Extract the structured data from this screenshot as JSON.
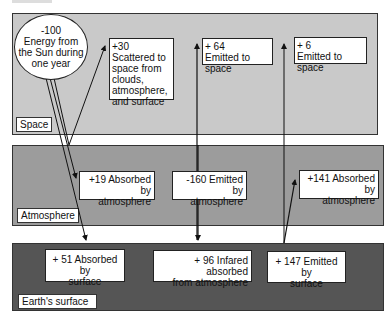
{
  "diagram": {
    "type": "energy-balance-flow",
    "layers": [
      {
        "id": "space",
        "label": "Space",
        "color": "#c9c9c9"
      },
      {
        "id": "atmosphere",
        "label": "Atmosphere",
        "color": "#9c9c9c"
      },
      {
        "id": "surface",
        "label": "Earth's surface",
        "color": "#555555"
      }
    ],
    "sun": {
      "line1": "-100",
      "line2": "Energy from",
      "line3": "the Sun during",
      "line4": "one year"
    },
    "flows": {
      "scattered": {
        "value": "+30",
        "l1": "Scattered to",
        "l2": "space from",
        "l3": "clouds,",
        "l4": "atmosphere,",
        "l5": "and surface"
      },
      "emitted64": {
        "value": "+ 64",
        "text": "Emitted to space"
      },
      "emitted6": {
        "value": "+ 6",
        "text": "Emitted to space"
      },
      "absorbed19": {
        "l1": "+19 Absorbed by",
        "l2": "atmosphere"
      },
      "emitted160": {
        "l1": "-160 Emitted by",
        "l2": "atmosphere"
      },
      "absorbed141": {
        "l1": "+141 Absorbed by",
        "l2": "atmosphere"
      },
      "absorbed51": {
        "l1": "+ 51 Absorbed by",
        "l2": "surface"
      },
      "infrared96": {
        "l1": "+ 96 Infared absorbed",
        "l2": "from atmosphere"
      },
      "emitted147": {
        "l1": "+ 147  Emitted by",
        "l2": "surface"
      }
    },
    "colors": {
      "line": "#111111",
      "box_bg": "#ffffff"
    }
  }
}
